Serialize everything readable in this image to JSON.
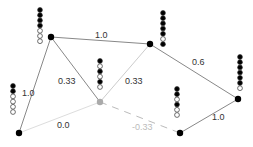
{
  "diagram": {
    "type": "weighted-graph",
    "nodes": [
      {
        "id": "A",
        "x": 19,
        "y": 133,
        "color": "#000000",
        "beads": {
          "x": 13,
          "y_top": 86,
          "pattern": [
            1,
            1,
            0,
            0,
            0,
            0
          ]
        }
      },
      {
        "id": "B",
        "x": 51,
        "y": 37,
        "color": "#000000",
        "beads": {
          "x": 40,
          "y_top": 10,
          "pattern": [
            1,
            1,
            1,
            1,
            0,
            0,
            0
          ]
        }
      },
      {
        "id": "C",
        "x": 100,
        "y": 102,
        "color": "#aaaaaa",
        "beads": {
          "x": 100,
          "y_top": 61,
          "pattern": [
            1,
            0,
            1,
            0,
            1,
            0
          ]
        }
      },
      {
        "id": "D",
        "x": 150,
        "y": 44,
        "color": "#000000",
        "beads": {
          "x": 163,
          "y_top": 13,
          "pattern": [
            1,
            1,
            1,
            1,
            1,
            0,
            1
          ]
        }
      },
      {
        "id": "E",
        "x": 180,
        "y": 133,
        "color": "#000000",
        "beads": {
          "x": 177,
          "y_top": 89,
          "pattern": [
            1,
            1,
            0,
            1,
            0,
            0
          ]
        }
      },
      {
        "id": "F",
        "x": 238,
        "y": 99,
        "color": "#000000",
        "beads": {
          "x": 240,
          "y_top": 57,
          "pattern": [
            1,
            1,
            1,
            1,
            1,
            1,
            0
          ]
        }
      }
    ],
    "edges": [
      {
        "from": "A",
        "to": "B",
        "label": "1.0",
        "lx": 22,
        "ly": 96,
        "style": "solid",
        "color": "#888888"
      },
      {
        "from": "B",
        "to": "C",
        "label": "0.33",
        "lx": 58,
        "ly": 84,
        "style": "solid",
        "color": "#888888"
      },
      {
        "from": "B",
        "to": "D",
        "label": "1.0",
        "lx": 95,
        "ly": 38,
        "style": "solid",
        "color": "#888888"
      },
      {
        "from": "C",
        "to": "D",
        "label": "0.33",
        "lx": 125,
        "ly": 84,
        "style": "solid",
        "color": "#cccccc"
      },
      {
        "from": "D",
        "to": "F",
        "label": "0.6",
        "lx": 192,
        "ly": 65,
        "style": "solid",
        "color": "#888888"
      },
      {
        "from": "A",
        "to": "C",
        "label": "0.0",
        "lx": 57,
        "ly": 128,
        "style": "solid",
        "color": "#dddddd"
      },
      {
        "from": "C",
        "to": "E",
        "label": "-0.33",
        "lx": 132,
        "ly": 130,
        "style": "dashed",
        "color": "#bbbbbb",
        "faded": true
      },
      {
        "from": "E",
        "to": "F",
        "label": "1.0",
        "lx": 212,
        "ly": 120,
        "style": "solid",
        "color": "#888888"
      }
    ]
  }
}
